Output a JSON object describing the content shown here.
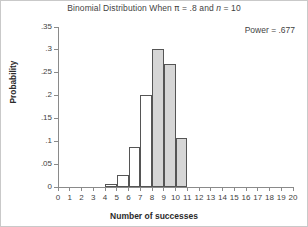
{
  "chart_data": {
    "type": "bar",
    "title": "Binomial Distribution When π = .8 and n = 10",
    "title_parts": {
      "lead": "Binomial Distribution When ",
      "pi": "π",
      "mid": " = .8 and ",
      "n": "n",
      "tail": " = 10"
    },
    "annotation": "Power = .677",
    "xlabel": "Number of successes",
    "ylabel": "Probability",
    "categories": [
      0,
      1,
      2,
      3,
      4,
      5,
      6,
      7,
      8,
      9,
      10
    ],
    "values": [
      0.0,
      0.0,
      0.0001,
      0.0008,
      0.0055,
      0.0264,
      0.0881,
      0.2013,
      0.302,
      0.2684,
      0.1074
    ],
    "bar_styles": [
      "open",
      "open",
      "open",
      "open",
      "open",
      "open",
      "open",
      "open",
      "fill",
      "fill",
      "fill"
    ],
    "xticks": [
      "0",
      "1",
      "2",
      "3",
      "4",
      "5",
      "6",
      "7",
      "8",
      "9",
      "10",
      "11",
      "12",
      "13",
      "14",
      "15",
      "16",
      "17",
      "18",
      "19",
      "20"
    ],
    "xlim": [
      0,
      20
    ],
    "yticks": [
      "0",
      ".05",
      ".1",
      ".15",
      ".2",
      ".25",
      ".3",
      ".35"
    ],
    "ytick_values": [
      0,
      0.05,
      0.1,
      0.15,
      0.2,
      0.25,
      0.3,
      0.35
    ],
    "ylim": [
      0,
      0.35
    ],
    "grid": false,
    "legend": "none",
    "colors": {
      "bar_fill_shaded": "#d6d6d6",
      "bar_fill_open": "#ffffff",
      "bar_outline": "#555555",
      "axis": "#8a8a8a",
      "text": "#3f3f3f",
      "label_text": "#2b2b2b",
      "border": "#c9c9c9",
      "background": "#ffffff"
    }
  }
}
